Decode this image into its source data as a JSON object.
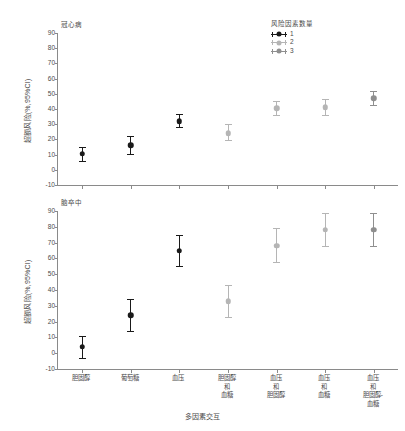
{
  "figure": {
    "xaxis_title": "多因素交互",
    "yaxis_title": "超额风险(%,95%CI)"
  },
  "legend": {
    "title": "风险因素数量",
    "entries": [
      {
        "label": "1",
        "color": "#1a1a1a"
      },
      {
        "label": "2",
        "color": "#b5b5b5"
      },
      {
        "label": "3",
        "color": "#8f8f8f"
      }
    ]
  },
  "categories": [
    "胆固醇",
    "葡萄糖",
    "血压",
    "胆固醇\n和\n血糖",
    "血压\n和\n胆固醇",
    "血压\n和\n血糖",
    "血压\n和\n胆固醇-\n血糖"
  ],
  "yticks": [
    "90",
    "80",
    "70",
    "60",
    "50",
    "40",
    "30",
    "20",
    "10",
    "0",
    "-10"
  ],
  "panels": [
    {
      "name": "chd",
      "title": "冠心病"
    },
    {
      "name": "stroke",
      "title": "脑卒中"
    }
  ],
  "chart_data": [
    {
      "type": "scatter",
      "title": "冠心病",
      "xlabel": "多因素交互",
      "ylabel": "超额风险(%,95%CI)",
      "ylim": [
        -10,
        90
      ],
      "ytick_step": 10,
      "grid": false,
      "legend_position": "top-right",
      "legend_title": "风险因素数量",
      "categories": [
        "胆固醇",
        "葡萄糖",
        "血压",
        "胆固醇和血糖",
        "血压和胆固醇",
        "血压和血糖",
        "血压和胆固醇-血糖"
      ],
      "series": [
        {
          "name": "1",
          "color": "#1a1a1a",
          "points": [
            {
              "category": "胆固醇",
              "value": 10.5,
              "ci_low": 5.5,
              "ci_high": 15.0
            },
            {
              "category": "葡萄糖",
              "value": 16.0,
              "ci_low": 10.5,
              "ci_high": 22.0
            },
            {
              "category": "血压",
              "value": 32.0,
              "ci_low": 28.0,
              "ci_high": 36.5
            }
          ]
        },
        {
          "name": "2",
          "color": "#b5b5b5",
          "points": [
            {
              "category": "胆固醇和血糖",
              "value": 24.0,
              "ci_low": 19.5,
              "ci_high": 30.0
            },
            {
              "category": "血压和胆固醇",
              "value": 40.5,
              "ci_low": 36.0,
              "ci_high": 45.5
            },
            {
              "category": "血压和血糖",
              "value": 41.0,
              "ci_low": 36.0,
              "ci_high": 46.5
            }
          ]
        },
        {
          "name": "3",
          "color": "#8f8f8f",
          "points": [
            {
              "category": "血压和胆固醇-血糖",
              "value": 47.0,
              "ci_low": 42.5,
              "ci_high": 52.0
            }
          ]
        }
      ]
    },
    {
      "type": "scatter",
      "title": "脑卒中",
      "xlabel": "多因素交互",
      "ylabel": "超额风险(%,95%CI)",
      "ylim": [
        -10,
        90
      ],
      "ytick_step": 10,
      "grid": false,
      "legend_position": "none",
      "categories": [
        "胆固醇",
        "葡萄糖",
        "血压",
        "胆固醇和血糖",
        "血压和胆固醇",
        "血压和血糖",
        "血压和胆固醇-血糖"
      ],
      "series": [
        {
          "name": "1",
          "color": "#1a1a1a",
          "points": [
            {
              "category": "胆固醇",
              "value": 4.0,
              "ci_low": -3.0,
              "ci_high": 11.0
            },
            {
              "category": "葡萄糖",
              "value": 24.0,
              "ci_low": 14.0,
              "ci_high": 34.0
            },
            {
              "category": "血压",
              "value": 65.0,
              "ci_low": 55.0,
              "ci_high": 75.0
            }
          ]
        },
        {
          "name": "2",
          "color": "#b5b5b5",
          "points": [
            {
              "category": "胆固醇和血糖",
              "value": 33.0,
              "ci_low": 23.0,
              "ci_high": 43.0
            },
            {
              "category": "血压和胆固醇",
              "value": 68.0,
              "ci_low": 58.0,
              "ci_high": 79.0
            },
            {
              "category": "血压和血糖",
              "value": 78.0,
              "ci_low": 68.0,
              "ci_high": 89.0
            }
          ]
        },
        {
          "name": "3",
          "color": "#8f8f8f",
          "points": [
            {
              "category": "血压和胆固醇-血糖",
              "value": 78.0,
              "ci_low": 68.0,
              "ci_high": 89.0
            }
          ]
        }
      ]
    }
  ]
}
